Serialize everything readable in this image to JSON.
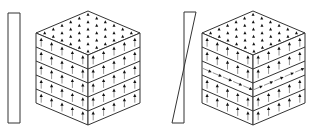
{
  "figure": {
    "width": 310,
    "height": 132,
    "background": "#ffffff",
    "stroke_color": "#333333",
    "arrow_color": "#111111",
    "panels": [
      {
        "id": "left",
        "profile": {
          "shape": "rectangle",
          "description": "uniform profile",
          "points": [
            [
              8,
              13
            ],
            [
              20,
              13
            ],
            [
              20,
              123
            ],
            [
              8,
              123
            ]
          ]
        },
        "cube": {
          "top": [
            88,
            11
          ],
          "left": [
            36,
            33
          ],
          "right": [
            140,
            33
          ],
          "front": [
            88,
            55
          ],
          "bottom": [
            88,
            125
          ],
          "layers": 5,
          "cols": 5,
          "top_grid": 6,
          "layer_arrows": [
            "up",
            "up",
            "up",
            "up",
            "up"
          ]
        }
      },
      {
        "id": "right",
        "profile": {
          "shape": "twisted-bar",
          "description": "linearly varying profile crossing zero at mid-height",
          "points": [
            [
              184,
              12
            ],
            [
              196,
              12
            ],
            [
              172,
              123
            ],
            [
              184,
              123
            ]
          ]
        },
        "cube": {
          "top": [
            253,
            11
          ],
          "left": [
            202,
            33
          ],
          "right": [
            305,
            33
          ],
          "front": [
            253,
            55
          ],
          "bottom": [
            253,
            125
          ],
          "layers": 5,
          "cols": 5,
          "top_grid": 6,
          "layer_arrows": [
            "up",
            "up",
            "horizontal",
            "up",
            "up"
          ]
        }
      }
    ]
  }
}
